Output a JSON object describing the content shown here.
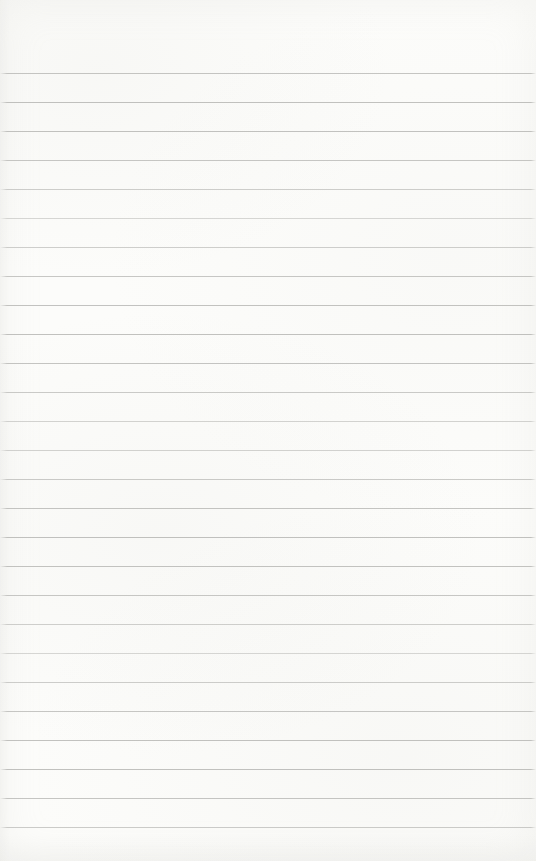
{
  "page": {
    "type": "blank-ruled-notebook-page",
    "paper_color": "#fcfcfa",
    "rule_color": "#b3b3b0",
    "rule_count": 27,
    "first_rule_top_px": 73,
    "rule_spacing_px": 29,
    "text_content": ""
  }
}
